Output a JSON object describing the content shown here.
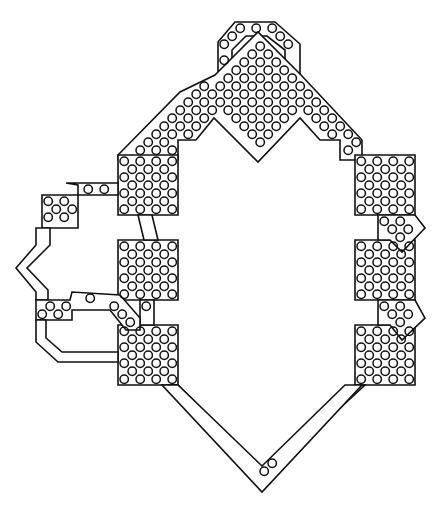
{
  "diagram": {
    "type": "fortification-plan",
    "style": {
      "stroke": "#111111",
      "background": "#ffffff",
      "dot_radius": 4.2,
      "dot_spacing": 16
    },
    "shapes": [
      {
        "name": "top-hood",
        "points": "218,42 235,22 275,22 300,44 300,75 285,75 285,50 267,36 246,36 232,50 232,75 218,75"
      },
      {
        "name": "top-wedge",
        "points": "215,75 258,32 301,75 362,140 362,160 340,160 340,140 320,140 300,118 258,162 214,118 196,140 178,140 178,160 118,160 118,155 180,92"
      },
      {
        "name": "left-upper-bastion",
        "points": "118,155 178,155 178,215 118,215"
      },
      {
        "name": "left-mid-bastion",
        "points": "118,240 178,240 178,300 118,300"
      },
      {
        "name": "left-lower-bastion",
        "points": "118,325 178,325 178,385 118,385"
      },
      {
        "name": "left-link-1",
        "points": "138,215 152,215 158,240 144,240"
      },
      {
        "name": "left-link-2",
        "points": "140,300 154,300 154,325 140,325"
      },
      {
        "name": "right-upper-bastion",
        "points": "355,155 415,155 415,215 355,215"
      },
      {
        "name": "right-mid-bastion",
        "points": "355,240 415,240 415,300 355,300"
      },
      {
        "name": "right-lower-bastion",
        "points": "355,325 415,325 415,385 355,385"
      },
      {
        "name": "right-spur-1",
        "points": "378,215 415,215 425,228 402,252 390,240 378,240"
      },
      {
        "name": "right-spur-2",
        "points": "378,300 415,300 425,318 402,340 390,325 378,325"
      },
      {
        "name": "outwork-box",
        "points": "42,195 78,195 78,228 42,228"
      },
      {
        "name": "outwork-upper-wall",
        "points": "66,183 118,183 118,195 78,195 78,185"
      },
      {
        "name": "outwork-west",
        "points": "42,228 50,228 50,245 27,268 48,290 48,300 36,300 36,292 16,268 36,245 36,228"
      },
      {
        "name": "outwork-lower-arm",
        "points": "36,300 70,300 72,292 120,295 140,318 140,330 126,330 110,310 72,310 72,320 36,320"
      },
      {
        "name": "outwork-lower-wall",
        "points": "36,320 46,320 46,338 62,352 118,352 118,362 58,362 36,342"
      },
      {
        "name": "bottom-left-wall",
        "points": "178,385 262,468 262,480 168,385"
      },
      {
        "name": "bottom-right-wall",
        "points": "262,468 355,385 365,385 262,480"
      },
      {
        "name": "bottom-v",
        "points": "162,385 178,385 262,466 345,385 362,385 262,492"
      }
    ]
  }
}
